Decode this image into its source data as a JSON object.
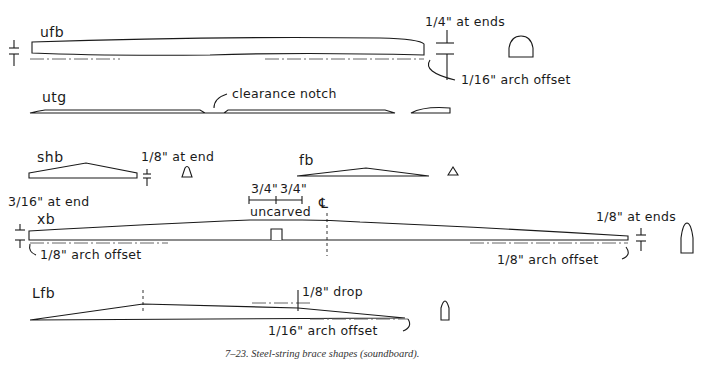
{
  "figure": {
    "caption": "7–23.   Steel-string brace shapes (soundboard).",
    "colors": {
      "ink": "#1a1a1a",
      "background": "#ffffff",
      "caption": "#333333"
    }
  },
  "braces": {
    "ufb": {
      "name": "ufb",
      "annotations": {
        "end_height": "1/4\" at ends",
        "arch": "1/16\" arch offset"
      },
      "profile": "rounded-half-round"
    },
    "utg": {
      "name": "utg",
      "annotations": {
        "notch": "clearance notch"
      },
      "profile": "flat-lens"
    },
    "shb": {
      "name": "shb",
      "annotations": {
        "end_height": "1/8\" at end"
      },
      "profile": "triangular-rounded"
    },
    "fb": {
      "name": "fb",
      "annotations": {},
      "profile": "triangle"
    },
    "xb": {
      "name": "xb",
      "annotations": {
        "left_end": "3/16\" at end",
        "dim_a": "3/4\"",
        "dim_b": "3/4\"",
        "uncarved": "uncarved",
        "centerline": "℄",
        "left_arch": "1/8\" arch offset",
        "right_end": "1/8\" at ends",
        "right_arch": "1/8\" arch offset"
      },
      "profile": "tall-bullet"
    },
    "lfb": {
      "name": "Lfb",
      "annotations": {
        "drop": "1/8\" drop",
        "arch": "1/16\" arch offset"
      },
      "profile": "narrow-bullet"
    }
  }
}
